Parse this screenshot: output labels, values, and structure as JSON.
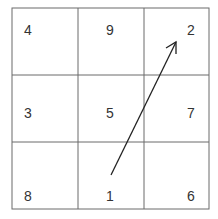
{
  "grid": {
    "rows": 3,
    "cols": 3,
    "line_color": "#6b6b6b",
    "cells": [
      [
        "4",
        "9",
        "2"
      ],
      [
        "3",
        "5",
        "7"
      ],
      [
        "8",
        "1",
        "6"
      ]
    ]
  },
  "arrow": {
    "from_cell": "1",
    "to_cell": "2",
    "color": "#222222"
  }
}
